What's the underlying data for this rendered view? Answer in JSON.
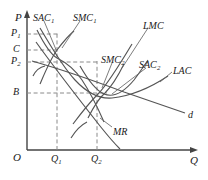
{
  "figure": {
    "type": "economics-diagram",
    "stroke_color": "#555555",
    "text_color": "#1a1a1a",
    "dash_color": "#888888"
  },
  "axes": {
    "y_label": "P",
    "x_label": "Q",
    "origin_label": "O",
    "y_ticks": [
      {
        "id": "p1",
        "label": "P",
        "sub": "1",
        "y": 34
      },
      {
        "id": "c",
        "label": "C",
        "sub": "",
        "y": 50
      },
      {
        "id": "p2",
        "label": "P",
        "sub": "2",
        "y": 62
      },
      {
        "id": "b",
        "label": "B",
        "sub": "",
        "y": 93
      }
    ],
    "x_ticks": [
      {
        "id": "q1",
        "label": "Q",
        "sub": "1",
        "x": 57
      },
      {
        "id": "q2",
        "label": "Q",
        "sub": "2",
        "x": 97
      }
    ]
  },
  "curves": [
    {
      "id": "sac1",
      "label": "SAC",
      "sub": "1",
      "label_x": 33,
      "label_y": 14
    },
    {
      "id": "smc1",
      "label": "SMC",
      "sub": "1",
      "label_x": 74,
      "label_y": 14
    },
    {
      "id": "lmc",
      "label": "LMC",
      "sub": "",
      "label_x": 143,
      "label_y": 23
    },
    {
      "id": "smc2",
      "label": "SMC",
      "sub": "2",
      "label_x": 103,
      "label_y": 57
    },
    {
      "id": "sac2",
      "label": "SAC",
      "sub": "2",
      "label_x": 140,
      "label_y": 62
    },
    {
      "id": "lac",
      "label": "LAC",
      "sub": "",
      "label_x": 173,
      "label_y": 68
    },
    {
      "id": "mr",
      "label": "MR",
      "sub": "",
      "label_x": 113,
      "label_y": 129
    },
    {
      "id": "d",
      "label": "d",
      "sub": "",
      "label_x": 189,
      "label_y": 112
    }
  ]
}
